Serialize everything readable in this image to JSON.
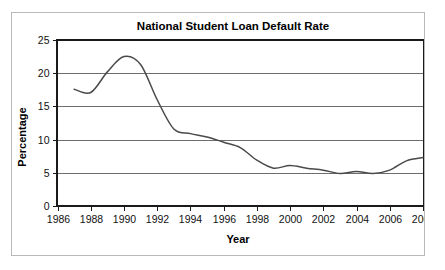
{
  "chart_data": {
    "type": "line",
    "title": "National Student Loan Default Rate",
    "xlabel": "Year",
    "ylabel": "Percentage",
    "xlim": [
      1986,
      2008
    ],
    "ylim": [
      0,
      25
    ],
    "xticks": [
      1986,
      1988,
      1990,
      1992,
      1994,
      1996,
      1998,
      2000,
      2002,
      2004,
      2006,
      2008
    ],
    "yticks": [
      0,
      5,
      10,
      15,
      20,
      25
    ],
    "grid": "horizontal",
    "legend": "none",
    "series": [
      {
        "name": "National Student Loan Default Rate",
        "color": "#4a4a4a",
        "x": [
          1987,
          1988,
          1989,
          1990,
          1991,
          1992,
          1993,
          1994,
          1995,
          1996,
          1997,
          1998,
          1999,
          2000,
          2001,
          2002,
          2003,
          2004,
          2005,
          2006,
          2007,
          2008
        ],
        "values": [
          17.6,
          17.1,
          20.2,
          22.5,
          21.3,
          16.0,
          11.6,
          10.9,
          10.4,
          9.6,
          8.8,
          6.9,
          5.7,
          6.1,
          5.7,
          5.4,
          4.9,
          5.2,
          4.9,
          5.4,
          6.8,
          7.3
        ]
      }
    ],
    "tick_label_strings": {
      "x": [
        "1986",
        "1988",
        "1990",
        "1992",
        "1994",
        "1996",
        "1998",
        "2000",
        "2002",
        "2004",
        "2006",
        "2008"
      ],
      "y": [
        "0",
        "5",
        "10",
        "15",
        "20",
        "25"
      ]
    }
  },
  "figure": {
    "frame_color": "#b9b9b9",
    "background": "#ffffff",
    "axis_color": "#1a1a1a",
    "grid_color": "#6d6d6d"
  }
}
